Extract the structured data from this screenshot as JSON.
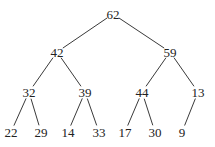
{
  "diagram": {
    "type": "binary-tree",
    "nodes": [
      {
        "id": "n62",
        "label": "62",
        "x": 113,
        "y": 14
      },
      {
        "id": "n42",
        "label": "42",
        "x": 57,
        "y": 52
      },
      {
        "id": "n59",
        "label": "59",
        "x": 170,
        "y": 52
      },
      {
        "id": "n32",
        "label": "32",
        "x": 29,
        "y": 92
      },
      {
        "id": "n39",
        "label": "39",
        "x": 85,
        "y": 92
      },
      {
        "id": "n44",
        "label": "44",
        "x": 142,
        "y": 92
      },
      {
        "id": "n13",
        "label": "13",
        "x": 198,
        "y": 92
      },
      {
        "id": "n22",
        "label": "22",
        "x": 11,
        "y": 132
      },
      {
        "id": "n29",
        "label": "29",
        "x": 41,
        "y": 132
      },
      {
        "id": "n14",
        "label": "14",
        "x": 68,
        "y": 132
      },
      {
        "id": "n33",
        "label": "33",
        "x": 99,
        "y": 132
      },
      {
        "id": "n17",
        "label": "17",
        "x": 125,
        "y": 132
      },
      {
        "id": "n30",
        "label": "30",
        "x": 155,
        "y": 132
      },
      {
        "id": "n9",
        "label": "9",
        "x": 182,
        "y": 132
      }
    ],
    "edges": [
      {
        "from": "n62",
        "to": "n42"
      },
      {
        "from": "n62",
        "to": "n59"
      },
      {
        "from": "n42",
        "to": "n32"
      },
      {
        "from": "n42",
        "to": "n39"
      },
      {
        "from": "n59",
        "to": "n44"
      },
      {
        "from": "n59",
        "to": "n13"
      },
      {
        "from": "n32",
        "to": "n22"
      },
      {
        "from": "n32",
        "to": "n29"
      },
      {
        "from": "n39",
        "to": "n14"
      },
      {
        "from": "n39",
        "to": "n33"
      },
      {
        "from": "n44",
        "to": "n17"
      },
      {
        "from": "n44",
        "to": "n30"
      },
      {
        "from": "n13",
        "to": "n9"
      }
    ],
    "colors": {
      "line": "#3a3a3a",
      "text": "#222222",
      "background": "#ffffff"
    }
  }
}
